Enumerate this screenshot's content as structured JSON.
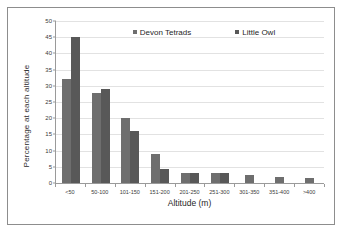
{
  "chart_data": {
    "type": "bar",
    "title": "",
    "xlabel": "Altitude (m)",
    "ylabel": "Percentage at each altitude",
    "categories": [
      "<50",
      "50-100",
      "101-150",
      "151-200",
      "201-250",
      "251-300",
      "301-350",
      "351-400",
      ">400"
    ],
    "series": [
      {
        "name": "Devon Tetrads",
        "color": "#6e6e6e",
        "values": [
          32,
          27.7,
          20,
          9,
          3,
          3,
          2.4,
          2,
          1.7
        ]
      },
      {
        "name": "Little Owl",
        "color": "#585858",
        "values": [
          45,
          29,
          16,
          4.3,
          3,
          3,
          0,
          0,
          0
        ]
      }
    ],
    "ylim": [
      0,
      50
    ],
    "yticks": [
      0,
      5,
      10,
      15,
      20,
      25,
      30,
      35,
      40,
      45,
      50
    ],
    "grid": true,
    "legend_position": "top-center"
  },
  "legend": {
    "items": [
      {
        "label": "Devon Tetrads"
      },
      {
        "label": "Little Owl"
      }
    ]
  },
  "axes": {
    "x_title": "Altitude (m)",
    "y_title": "Percentage at each altitude"
  }
}
